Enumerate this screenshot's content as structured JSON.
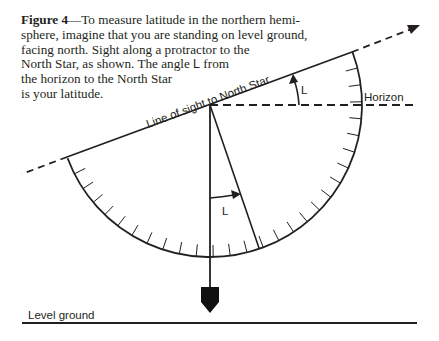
{
  "caption": {
    "figure_label": "Figure 4",
    "dash": "—",
    "lines": [
      "To measure latitude in the northern hemi-",
      "sphere, imagine that you are standing on level ground,",
      "facing north. Sight along a protractor to the",
      "North Star, as shown. The angle ",
      "the horizon to the North Star",
      "is your latitude."
    ],
    "angle_symbol": "L",
    "line4_tail": " from"
  },
  "labels": {
    "line_of_sight": "Line of sight to North Star",
    "horizon": "Horizon",
    "angle_upper": "L",
    "angle_lower": "L",
    "level_ground": "Level ground"
  },
  "geometry": {
    "pivot": [
      210,
      105
    ],
    "protractor_radius": 152,
    "sight_angle_deg": 20.5,
    "tick_count": 28,
    "tick_length": 12
  },
  "colors": {
    "ink": "#231f20",
    "background": "#ffffff"
  }
}
